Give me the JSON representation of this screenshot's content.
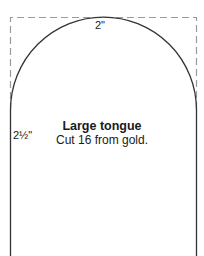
{
  "pattern": {
    "title": "Large tongue",
    "instruction": "Cut 16 from gold.",
    "dimensions": {
      "width_label": "2\"",
      "height_label": "2½\""
    },
    "colors": {
      "outline": "#333333",
      "dashed_guide": "#9a9a9a",
      "text": "#1a1a1a"
    }
  }
}
